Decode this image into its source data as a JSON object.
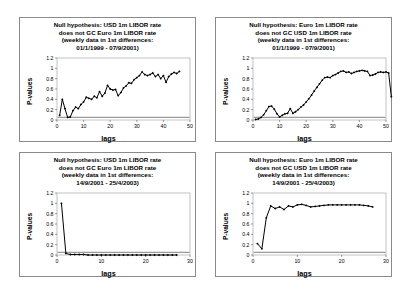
{
  "figure": {
    "background_color": "#ffffff",
    "panel_border_color": "#8a8a8a",
    "series_color": "#000000",
    "significance_line_color": "#9a9a9a"
  },
  "panels": [
    {
      "id": "panel-top-left",
      "title_lines": [
        "Null hypothesis: USD 1m LIBOR rate",
        "does not GC Euro 1m LIBOR rate",
        "(weekly data in 1st differences:",
        "01/1/1999 - 07/9/2001)"
      ],
      "chart_data": {
        "type": "line",
        "title": "Null hypothesis: USD 1m LIBOR rate does not GC Euro 1m LIBOR rate (weekly data in 1st differences: 01/1/1999 - 07/9/2001)",
        "xlabel": "lags",
        "ylabel": "P-values",
        "xlim": [
          0,
          50
        ],
        "ylim": [
          0,
          1.2
        ],
        "xticks": [
          0,
          10,
          20,
          30,
          40,
          50
        ],
        "yticks": [
          0,
          0.2,
          0.4,
          0.6,
          0.8,
          1,
          1.2
        ],
        "ytick_labels": [
          "0",
          "0.2",
          "0.4",
          "0.6",
          "0.8",
          "1",
          "1.2"
        ],
        "grid": false,
        "legend": "none",
        "marker": "diamond",
        "significance_level": 0.05,
        "x": [
          1,
          2,
          3,
          4,
          5,
          6,
          7,
          8,
          9,
          10,
          11,
          12,
          13,
          14,
          15,
          16,
          17,
          18,
          19,
          20,
          21,
          22,
          23,
          24,
          25,
          26,
          27,
          28,
          29,
          30,
          31,
          32,
          33,
          34,
          35,
          36,
          37,
          38,
          39,
          40,
          41,
          42,
          43,
          44,
          45,
          46
        ],
        "values": [
          0.09,
          0.4,
          0.22,
          0.05,
          0.06,
          0.18,
          0.25,
          0.22,
          0.3,
          0.35,
          0.44,
          0.42,
          0.4,
          0.46,
          0.43,
          0.55,
          0.46,
          0.52,
          0.67,
          0.6,
          0.58,
          0.59,
          0.47,
          0.53,
          0.62,
          0.66,
          0.72,
          0.71,
          0.78,
          0.82,
          0.86,
          0.93,
          0.88,
          0.86,
          0.88,
          0.91,
          0.84,
          0.88,
          0.8,
          0.86,
          0.73,
          0.84,
          0.89,
          0.92,
          0.9,
          0.94
        ]
      }
    },
    {
      "id": "panel-top-right",
      "title_lines": [
        "Null hypothesis: Euro 1m LIBOR rate",
        "does not GC USD 1m LIBOR rate",
        "(weekly data in 1st differences:",
        "01/1/1999 - 07/9/2001)"
      ],
      "chart_data": {
        "type": "line",
        "title": "Null hypothesis: Euro 1m LIBOR rate does not GC USD 1m LIBOR rate (weekly data in 1st differences: 01/1/1999 - 07/9/2001)",
        "xlabel": "lags",
        "ylabel": "P-values",
        "xlim": [
          0,
          50
        ],
        "ylim": [
          0,
          1.2
        ],
        "xticks": [
          0,
          10,
          20,
          30,
          40,
          50
        ],
        "yticks": [
          0,
          0.2,
          0.4,
          0.6,
          0.8,
          1,
          1.2
        ],
        "ytick_labels": [
          "0",
          "0.2",
          "0.4",
          "0.6",
          "0.8",
          "1",
          "1.2"
        ],
        "grid": false,
        "legend": "none",
        "marker": "diamond",
        "significance_level": 0.05,
        "x": [
          1,
          2,
          3,
          4,
          5,
          6,
          7,
          8,
          9,
          10,
          11,
          12,
          13,
          14,
          15,
          16,
          17,
          18,
          19,
          20,
          21,
          22,
          23,
          24,
          25,
          26,
          27,
          28,
          29,
          30,
          31,
          32,
          33,
          34,
          35,
          36,
          37,
          38,
          39,
          40,
          41,
          42,
          43,
          44,
          45,
          46,
          47,
          48,
          49,
          50,
          51,
          52
        ],
        "values": [
          0.01,
          0.02,
          0.05,
          0.1,
          0.18,
          0.26,
          0.27,
          0.21,
          0.12,
          0.06,
          0.09,
          0.12,
          0.13,
          0.22,
          0.13,
          0.16,
          0.2,
          0.25,
          0.29,
          0.35,
          0.41,
          0.48,
          0.56,
          0.63,
          0.7,
          0.77,
          0.82,
          0.83,
          0.82,
          0.86,
          0.88,
          0.91,
          0.94,
          0.95,
          0.92,
          0.93,
          0.9,
          0.92,
          0.94,
          0.95,
          0.96,
          0.95,
          0.94,
          0.86,
          0.87,
          0.89,
          0.92,
          0.93,
          0.92,
          0.93,
          0.91,
          0.45
        ]
      }
    },
    {
      "id": "panel-bottom-left",
      "title_lines": [
        "Null hypothesis: USD 1m LIBOR rate",
        "does not GC Euro 1m LIBOR rate",
        "(weekly data in 1st differences:",
        "14/9/2001 - 25/4/2003)"
      ],
      "chart_data": {
        "type": "line",
        "title": "Null hypothesis: USD 1m LIBOR rate does not GC Euro 1m LIBOR rate (weekly data in 1st differences: 14/9/2001 - 25/4/2003)",
        "xlabel": "lags",
        "ylabel": "P-values",
        "xlim": [
          0,
          30
        ],
        "ylim": [
          0,
          1.2
        ],
        "xticks": [
          0,
          10,
          20,
          30
        ],
        "yticks": [
          0,
          0.2,
          0.4,
          0.6,
          0.8,
          1,
          1.2
        ],
        "ytick_labels": [
          "0",
          "0.2",
          "0.4",
          "0.6",
          "0.8",
          "1",
          "1.2"
        ],
        "grid": false,
        "legend": "none",
        "marker": "diamond",
        "significance_level": 0.05,
        "x": [
          1,
          2,
          3,
          4,
          5,
          6,
          7,
          8,
          9,
          10,
          11,
          12,
          13,
          14,
          15,
          16,
          17,
          18,
          19,
          20,
          21,
          22,
          23,
          24,
          25,
          26,
          27
        ],
        "values": [
          1.0,
          0.03,
          0.01,
          0.01,
          0.01,
          0.01,
          0.0,
          0.0,
          0.0,
          0.0,
          0.0,
          0.0,
          0.0,
          0.0,
          0.0,
          0.0,
          0.0,
          0.0,
          0.0,
          0.0,
          0.0,
          0.0,
          0.0,
          0.0,
          0.0,
          0.0,
          0.0
        ]
      }
    },
    {
      "id": "panel-bottom-right",
      "title_lines": [
        "Null hypothesis: Euro 1m LIBOR rate",
        "does not GC USD 1m LIBOR rate",
        "(weekly data in 1st differences:",
        "14/9/2001 - 25/4/2003)"
      ],
      "chart_data": {
        "type": "line",
        "title": "Null hypothesis: Euro 1m LIBOR rate does not GC USD 1m LIBOR rate (weekly data in 1st differences: 14/9/2001 - 25/4/2003)",
        "xlabel": "lags",
        "ylabel": "P-values",
        "xlim": [
          0,
          30
        ],
        "ylim": [
          0,
          1.2
        ],
        "xticks": [
          0,
          10,
          20,
          30
        ],
        "yticks": [
          0,
          0.2,
          0.4,
          0.6,
          0.8,
          1,
          1.2
        ],
        "ytick_labels": [
          "0",
          "0.2",
          "0.4",
          "0.6",
          "0.8",
          "1",
          "1.2"
        ],
        "grid": false,
        "legend": "none",
        "marker": "diamond",
        "significance_level": 0.05,
        "x": [
          1,
          2,
          3,
          4,
          5,
          6,
          7,
          8,
          9,
          10,
          11,
          12,
          13,
          14,
          15,
          16,
          17,
          18,
          19,
          20,
          21,
          22,
          23,
          24,
          25,
          26,
          27
        ],
        "values": [
          0.22,
          0.12,
          0.72,
          0.95,
          0.9,
          0.93,
          0.88,
          0.95,
          0.93,
          0.97,
          0.98,
          0.96,
          0.93,
          0.94,
          0.95,
          0.96,
          0.97,
          0.97,
          0.97,
          0.97,
          0.97,
          0.97,
          0.97,
          0.97,
          0.96,
          0.95,
          0.93
        ]
      }
    }
  ]
}
